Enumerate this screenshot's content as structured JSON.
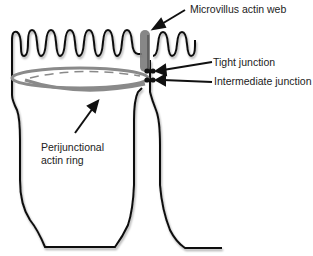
{
  "diagram": {
    "labels": {
      "microvillus_actin_web": "Microvillus actin web",
      "tight_junction": "Tight junction",
      "intermediate_junction": "Intermediate junction",
      "perijunctional_line1": "Perijunctional",
      "perijunctional_line2": "actin ring"
    },
    "colors": {
      "outline": "#111111",
      "actin_ring": "#8a8a8a",
      "actin_web": "#7a7a7a",
      "background": "#ffffff"
    }
  }
}
